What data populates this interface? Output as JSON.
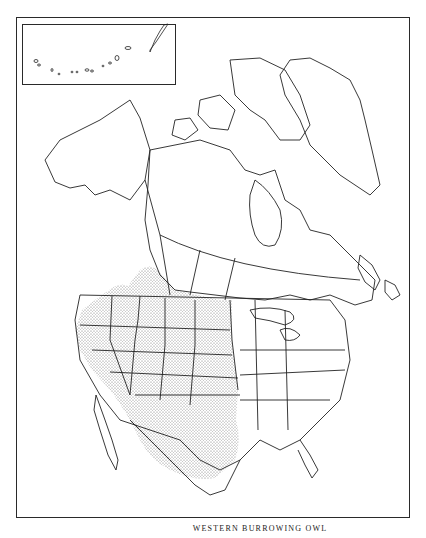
{
  "map": {
    "title": "WESTERN BURROWING OWL",
    "subject": "Range map of North America",
    "inset_region": "Aleutian Islands / Alaska inset",
    "legend": {
      "stippled_area": "Range of the Western Burrowing Owl"
    },
    "colors": {
      "line": "#222222",
      "stipple": "#555555",
      "background": "#ffffff"
    },
    "range_regions": [
      "Southern Canadian prairies",
      "Great Plains",
      "Western United States",
      "California",
      "Baja California",
      "Northern & Central Mexico",
      "Texas"
    ]
  }
}
